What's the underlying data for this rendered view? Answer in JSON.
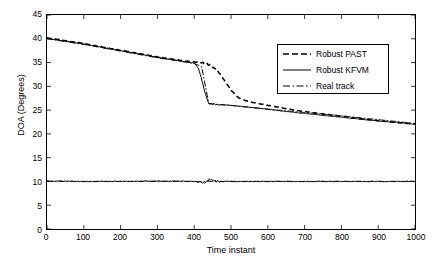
{
  "chart_data": {
    "type": "line",
    "title": "",
    "xlabel": "Time instant",
    "ylabel": "DOA (Degrees)",
    "xlim": [
      0,
      1000
    ],
    "ylim": [
      0,
      45
    ],
    "xticks": [
      0,
      100,
      200,
      300,
      400,
      500,
      600,
      700,
      800,
      900,
      1000
    ],
    "yticks": [
      0,
      5,
      10,
      15,
      20,
      25,
      30,
      35,
      40,
      45
    ],
    "grid": false,
    "legend_position": "upper right",
    "legend": [
      "Robust PAST",
      "Robust KFVM",
      "Real track"
    ],
    "series": [
      {
        "name": "Robust PAST",
        "style": "dashed",
        "color": "#000000",
        "x": [
          0,
          50,
          100,
          150,
          200,
          250,
          300,
          350,
          400,
          420,
          440,
          460,
          480,
          500,
          520,
          540,
          560,
          580,
          600,
          650,
          700,
          750,
          800,
          850,
          900,
          950,
          1000
        ],
        "y": [
          40.2,
          39.6,
          39.0,
          38.3,
          37.6,
          36.9,
          36.2,
          35.6,
          35.1,
          35.0,
          34.6,
          33.6,
          31.5,
          29.2,
          27.6,
          27.0,
          26.6,
          26.3,
          26.0,
          25.3,
          24.7,
          24.2,
          23.7,
          23.2,
          22.8,
          22.4,
          22.1
        ]
      },
      {
        "name": "Robust KFVM",
        "style": "solid",
        "color": "#000000",
        "x": [
          0,
          50,
          100,
          150,
          200,
          250,
          300,
          350,
          400,
          410,
          420,
          430,
          440,
          460,
          480,
          500,
          550,
          600,
          650,
          700,
          750,
          800,
          850,
          900,
          950,
          1000
        ],
        "y": [
          40.1,
          39.5,
          38.9,
          38.2,
          37.5,
          36.8,
          36.1,
          35.5,
          34.9,
          34.0,
          31.5,
          28.5,
          26.4,
          26.2,
          26.1,
          26.0,
          25.6,
          25.2,
          24.7,
          24.3,
          23.9,
          23.5,
          23.1,
          22.7,
          22.4,
          22.0
        ]
      },
      {
        "name": "Real track (upper)",
        "style": "dashdot",
        "color": "#000000",
        "x": [
          0,
          100,
          200,
          300,
          400,
          420,
          440,
          500,
          600,
          700,
          800,
          900,
          1000
        ],
        "y": [
          40.0,
          38.8,
          37.4,
          36.0,
          34.8,
          34.2,
          26.3,
          26.0,
          25.2,
          24.5,
          23.8,
          23.0,
          22.2
        ]
      },
      {
        "name": "Real track (lower)",
        "style": "dashdot",
        "color": "#000000",
        "x": [
          0,
          100,
          200,
          300,
          400,
          430,
          460,
          500,
          600,
          700,
          800,
          900,
          1000
        ],
        "y": [
          10.0,
          10.0,
          10.0,
          10.0,
          10.0,
          10.0,
          10.0,
          10.0,
          10.0,
          10.0,
          10.0,
          10.0,
          10.0
        ]
      },
      {
        "name": "Lower estimates",
        "style": "solid-noisy",
        "color": "#000000",
        "x": [
          0,
          100,
          200,
          300,
          400,
          430,
          440,
          460,
          500,
          600,
          700,
          800,
          900,
          1000
        ],
        "y": [
          10.1,
          10.0,
          10.0,
          10.1,
          10.0,
          9.6,
          10.4,
          10.0,
          10.0,
          10.0,
          10.0,
          10.0,
          10.0,
          10.0
        ]
      }
    ]
  },
  "axes": {
    "xtick_labels": [
      "0",
      "100",
      "200",
      "300",
      "400",
      "500",
      "600",
      "700",
      "800",
      "900",
      "1000"
    ],
    "ytick_labels": [
      "0",
      "5",
      "10",
      "15",
      "20",
      "25",
      "30",
      "35",
      "40",
      "45"
    ],
    "xlabel": "Time instant",
    "ylabel": "DOA (Degrees)"
  },
  "legend": {
    "items": [
      {
        "label": "Robust PAST",
        "style": "dashed"
      },
      {
        "label": "Robust KFVM",
        "style": "solid"
      },
      {
        "label": "Real track",
        "style": "dashdot"
      }
    ]
  }
}
